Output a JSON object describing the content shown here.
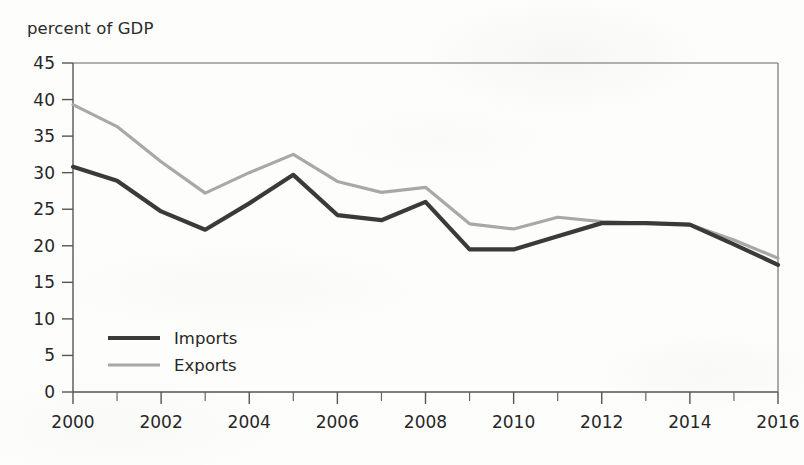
{
  "chart_data": {
    "type": "line",
    "title": "",
    "ylabel": "percent of GDP",
    "xlabel": "",
    "x": [
      2000,
      2001,
      2002,
      2003,
      2004,
      2005,
      2006,
      2007,
      2008,
      2009,
      2010,
      2011,
      2012,
      2013,
      2014,
      2015,
      2016
    ],
    "categories": [
      "2000",
      "2001",
      "2002",
      "2003",
      "2004",
      "2005",
      "2006",
      "2007",
      "2008",
      "2009",
      "2010",
      "2011",
      "2012",
      "2013",
      "2014",
      "2015",
      "2016"
    ],
    "series": [
      {
        "name": "Imports",
        "color": "#3a3a3a",
        "values": [
          30.8,
          28.9,
          24.7,
          22.2,
          25.8,
          29.7,
          24.2,
          23.5,
          26.0,
          19.5,
          19.5,
          21.3,
          23.1,
          23.1,
          22.9,
          20.2,
          17.4
        ]
      },
      {
        "name": "Exports",
        "color": "#a8a8a8",
        "values": [
          39.3,
          36.3,
          31.5,
          27.2,
          30.0,
          32.5,
          28.8,
          27.3,
          28.0,
          23.0,
          22.3,
          23.9,
          23.3,
          23.1,
          22.9,
          20.8,
          18.3
        ]
      }
    ],
    "xlim": [
      2000,
      2016
    ],
    "ylim": [
      0,
      45
    ],
    "ytick_values": [
      0,
      5,
      10,
      15,
      20,
      25,
      30,
      35,
      40,
      45
    ],
    "ytick_labels": [
      "0",
      "5",
      "10",
      "15",
      "20",
      "25",
      "30",
      "35",
      "40",
      "45"
    ],
    "xtick_values": [
      2000,
      2002,
      2004,
      2006,
      2008,
      2010,
      2012,
      2014,
      2016
    ],
    "xtick_labels": [
      "2000",
      "2002",
      "2004",
      "2006",
      "2008",
      "2010",
      "2012",
      "2014",
      "2016"
    ],
    "xtick_minor_values": [
      2001,
      2003,
      2005,
      2007,
      2009,
      2011,
      2013,
      2015
    ],
    "grid": false,
    "legend": {
      "position": "lower-left-inside",
      "entries": [
        {
          "label": "Imports",
          "color": "#3a3a3a",
          "width": 4.0
        },
        {
          "label": "Exports",
          "color": "#a8a8a8",
          "width": 3.0
        }
      ]
    }
  },
  "page": {
    "background_color": "#fdfdfc",
    "axis_color": "#555555",
    "text_color": "#262626"
  }
}
